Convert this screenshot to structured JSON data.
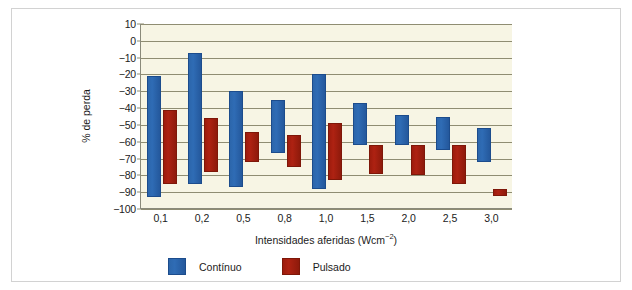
{
  "chart_data": {
    "type": "bar",
    "subtype": "floating-range-bar",
    "title": "",
    "xlabel": "Intensidades aferidas (Wcm⁻²)",
    "ylabel": "% de perda",
    "categories": [
      "0,1",
      "0,2",
      "0,5",
      "0,8",
      "1,0",
      "1,5",
      "2,0",
      "2,5",
      "3,0"
    ],
    "ylim": [
      -100,
      10
    ],
    "yticks": [
      10,
      0,
      -10,
      -20,
      -30,
      -40,
      -50,
      -60,
      -70,
      -80,
      -90,
      -100
    ],
    "ytick_labels": [
      "10",
      "0",
      "−10",
      "−20",
      "−30",
      "−40",
      "−50",
      "−60",
      "−70",
      "−80",
      "−90",
      "−100"
    ],
    "grid": true,
    "legend_position": "bottom",
    "series": [
      {
        "name": "Contínuo",
        "color": "#2f6cb5",
        "ranges": [
          {
            "category": "0,1",
            "high": -21,
            "low": -93
          },
          {
            "category": "0,2",
            "high": -7,
            "low": -85
          },
          {
            "category": "0,5",
            "high": -30,
            "low": -87
          },
          {
            "category": "0,8",
            "high": -35,
            "low": -67
          },
          {
            "category": "1,0",
            "high": -20,
            "low": -88
          },
          {
            "category": "1,5",
            "high": -37,
            "low": -62
          },
          {
            "category": "2,0",
            "high": -44,
            "low": -62
          },
          {
            "category": "2,5",
            "high": -45,
            "low": -65
          },
          {
            "category": "3,0",
            "high": -52,
            "low": -72
          }
        ]
      },
      {
        "name": "Pulsado",
        "color": "#ae2212",
        "ranges": [
          {
            "category": "0,1",
            "high": -41,
            "low": -85
          },
          {
            "category": "0,2",
            "high": -46,
            "low": -78
          },
          {
            "category": "0,5",
            "high": -54,
            "low": -72
          },
          {
            "category": "0,8",
            "high": -56,
            "low": -75
          },
          {
            "category": "1,0",
            "high": -49,
            "low": -83
          },
          {
            "category": "1,5",
            "high": -62,
            "low": -79
          },
          {
            "category": "2,0",
            "high": -62,
            "low": -80
          },
          {
            "category": "2,5",
            "high": -62,
            "low": -85
          },
          {
            "category": "3,0",
            "high": -88,
            "low": -92
          }
        ]
      }
    ]
  },
  "legend": {
    "items": [
      {
        "label": "Contínuo",
        "color": "#2f6cb5"
      },
      {
        "label": "Pulsado",
        "color": "#ae2212"
      }
    ]
  },
  "axis_label_parts": {
    "xlabel_main": "Intensidades aferidas (Wcm",
    "xlabel_sup": "−2",
    "xlabel_tail": ")"
  }
}
